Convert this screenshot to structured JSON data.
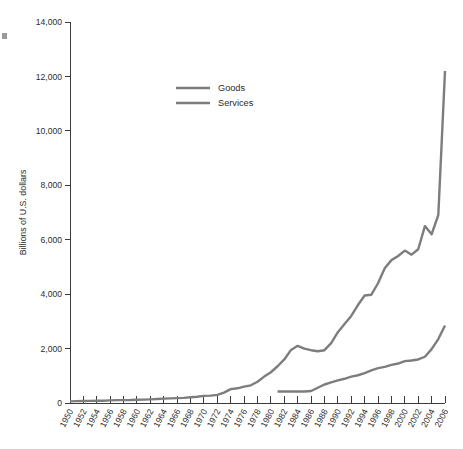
{
  "chart_data": {
    "type": "line",
    "title": "",
    "subtitle": "",
    "xlabel": "",
    "ylabel": "Billions of U.S. dollars",
    "ylim": [
      0,
      14000
    ],
    "xlim": [
      1950,
      2006
    ],
    "grid": false,
    "legend_position": "upper-left-inside",
    "y_ticks": [
      0,
      2000,
      4000,
      6000,
      8000,
      10000,
      12000,
      14000
    ],
    "y_tick_labels": [
      "0",
      "2,000",
      "4,000",
      "6,000",
      "8,000",
      "10,000",
      "12,000",
      "14,000"
    ],
    "x_ticks": [
      1950,
      1952,
      1954,
      1956,
      1958,
      1960,
      1962,
      1964,
      1966,
      1968,
      1970,
      1972,
      1974,
      1976,
      1978,
      1980,
      1982,
      1984,
      1986,
      1988,
      1990,
      1992,
      1994,
      1996,
      1998,
      2000,
      2002,
      2004,
      2006
    ],
    "x_tick_labels": [
      "1950",
      "1952",
      "1954",
      "1956",
      "1958",
      "1960",
      "1962",
      "1964",
      "1966",
      "1968",
      "1970",
      "1972",
      "1974",
      "1976",
      "1978",
      "1980",
      "1982",
      "1984",
      "1986",
      "1988",
      "1990",
      "1992",
      "1994",
      "1996",
      "1998",
      "2000",
      "2002",
      "2004",
      "2006"
    ],
    "series": [
      {
        "name": "Services",
        "color": "#7d7d7d",
        "x": [
          1950,
          1951,
          1952,
          1953,
          1954,
          1955,
          1956,
          1957,
          1958,
          1959,
          1960,
          1961,
          1962,
          1963,
          1964,
          1965,
          1966,
          1967,
          1968,
          1969,
          1970,
          1971,
          1972,
          1973,
          1974,
          1975,
          1976,
          1977,
          1978,
          1979,
          1980,
          1981,
          1982,
          1983,
          1984,
          1985,
          1986,
          1987,
          1988,
          1989,
          1990,
          1991,
          1992,
          1993,
          1994,
          1995,
          1996,
          1997,
          1998,
          1999,
          2000,
          2001,
          2002,
          2003,
          2004,
          2005,
          2006
        ],
        "y": [
          60,
          70,
          75,
          78,
          80,
          85,
          95,
          105,
          105,
          110,
          120,
          125,
          135,
          145,
          160,
          170,
          180,
          190,
          210,
          230,
          260,
          270,
          300,
          380,
          510,
          540,
          600,
          650,
          780,
          970,
          1130,
          1350,
          1600,
          1950,
          2100,
          2000,
          1940,
          1900,
          1940,
          2200,
          2600,
          2900,
          3200,
          3600,
          3950,
          3980,
          4400,
          4950,
          5250,
          5400,
          5600,
          5450,
          5650,
          6500,
          6200,
          6900,
          12200
        ],
        "unit": "billions of U.S. dollars"
      },
      {
        "name": "Goods",
        "color": "#7d7d7d",
        "x": [
          1981,
          1982,
          1983,
          1984,
          1985,
          1986,
          1987,
          1988,
          1989,
          1990,
          1991,
          1992,
          1993,
          1994,
          1995,
          1996,
          1997,
          1998,
          1999,
          2000,
          2001,
          2002,
          2003,
          2004,
          2005,
          2006
        ],
        "y": [
          420,
          420,
          420,
          420,
          420,
          440,
          560,
          680,
          760,
          830,
          890,
          970,
          1020,
          1100,
          1200,
          1280,
          1330,
          1400,
          1450,
          1540,
          1560,
          1600,
          1700,
          1980,
          2350,
          2850
        ],
        "unit": "billions of U.S. dollars"
      }
    ],
    "legend_entries": [
      "Goods",
      "Services"
    ],
    "annotations": []
  },
  "legend": {
    "items": [
      {
        "label": "Goods"
      },
      {
        "label": "Services"
      }
    ]
  },
  "axes": {
    "y_title": "Billions of U.S. dollars"
  },
  "colors": {
    "line": "#7d7d7d",
    "axis": "#3b3b3b",
    "text": "#2b2b2b",
    "background": "#ffffff"
  }
}
